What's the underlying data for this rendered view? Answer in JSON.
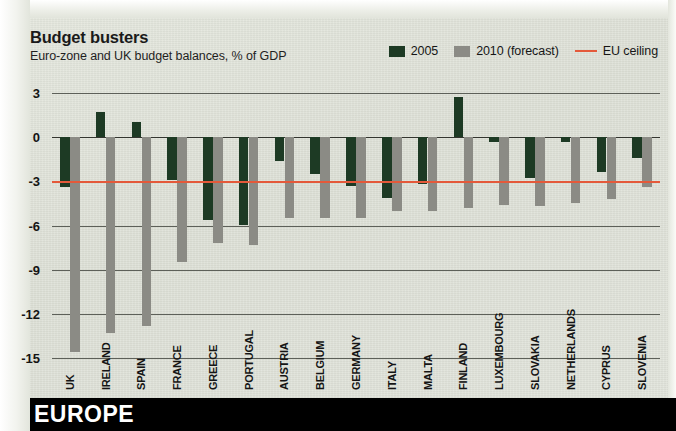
{
  "header": {
    "title": "Budget busters",
    "subtitle": "Euro-zone and UK budget balances, % of GDP"
  },
  "footer": {
    "section_label": "EUROPE"
  },
  "legend": {
    "items": [
      {
        "label": "2005",
        "type": "swatch",
        "color": "#1d3a24",
        "icon": "legend-swatch-2005"
      },
      {
        "label": "2010 (forecast)",
        "type": "swatch",
        "color": "#8b8b85",
        "icon": "legend-swatch-2010"
      },
      {
        "label": "EU ceiling",
        "type": "rule",
        "color": "#e4593a",
        "icon": "legend-rule-eu-ceiling"
      }
    ]
  },
  "colors": {
    "series_2005": "#1d3a24",
    "series_2010": "#8b8b85",
    "eu_ceiling": "#e4593a",
    "background": "#dfe2d9",
    "gridline": "#5d6059",
    "banner": "#000000",
    "banner_text": "#ffffff"
  },
  "chart_data": {
    "type": "bar",
    "title": "Budget busters",
    "subtitle": "Euro-zone and UK budget balances, % of GDP",
    "xlabel": "",
    "ylabel": "% of GDP",
    "ylim": [
      -15,
      3
    ],
    "yticks": [
      3,
      0,
      -3,
      -6,
      -9,
      -12,
      -15
    ],
    "ytick_labels": [
      "3",
      "0",
      "-3",
      "-6",
      "-9",
      "-12",
      "-15"
    ],
    "grid": true,
    "legend_position": "top-right",
    "reference_lines": [
      {
        "label": "EU ceiling",
        "value": -3,
        "color": "#e4593a"
      }
    ],
    "categories": [
      "UK",
      "IRELAND",
      "SPAIN",
      "FRANCE",
      "GREECE",
      "PORTUGAL",
      "AUSTRIA",
      "BELGIUM",
      "GERMANY",
      "ITALY",
      "MALTA",
      "FINLAND",
      "LUXEMBOURG",
      "SLOVAKIA",
      "NETHERLANDS",
      "CYPRUS",
      "SLOVENIA"
    ],
    "series": [
      {
        "name": "2005",
        "color": "#1d3a24",
        "values": [
          -3.4,
          1.7,
          1.0,
          -2.9,
          -5.6,
          -6.0,
          -1.6,
          -2.5,
          -3.3,
          -4.1,
          -3.2,
          2.7,
          -0.3,
          -2.8,
          -0.3,
          -2.4,
          -1.4
        ]
      },
      {
        "name": "2010 (forecast)",
        "color": "#8b8b85",
        "values": [
          -14.6,
          -13.3,
          -12.8,
          -8.5,
          -7.2,
          -7.3,
          -5.5,
          -5.5,
          -5.5,
          -5.0,
          -5.0,
          -4.8,
          -4.6,
          -4.7,
          -4.5,
          -4.2,
          -3.4
        ]
      }
    ]
  }
}
